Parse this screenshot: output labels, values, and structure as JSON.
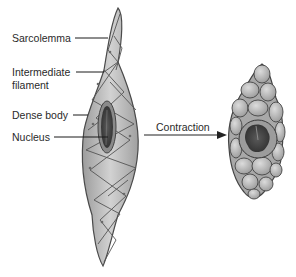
{
  "diagram": {
    "labels": {
      "sarcolemma": "Sarcolemma",
      "intermediate_line1": "Intermediate",
      "intermediate_line2": "filament",
      "dense_body": "Dense body",
      "nucleus": "Nucleus",
      "contraction": "Contraction"
    },
    "states": [
      "relaxed",
      "contracted"
    ],
    "colors": {
      "cell_fill": "#b8b8b8",
      "cell_light": "#d4d4d4",
      "outline": "#4a4a4a",
      "nucleus": "#3c3c3c",
      "leader_line": "#1a1a1a",
      "background": "#ffffff"
    }
  }
}
